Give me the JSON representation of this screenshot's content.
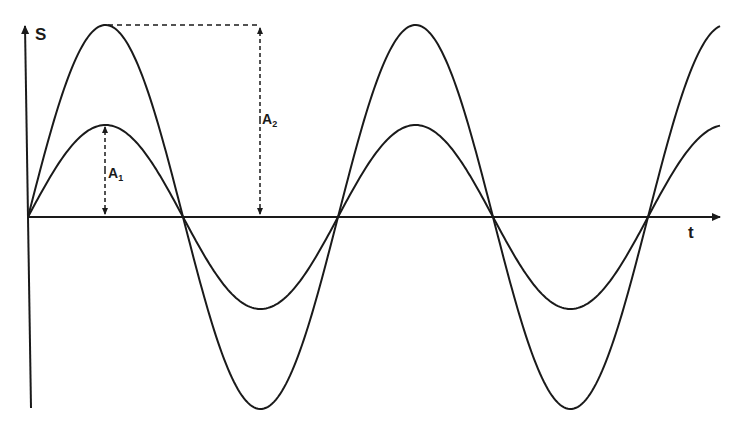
{
  "figure": {
    "y_axis_label": "S",
    "x_axis_label": "t",
    "amplitude_1_label": "A",
    "amplitude_1_sub": "1",
    "amplitude_2_label": "A",
    "amplitude_2_sub": "2"
  },
  "chart_data": {
    "type": "line",
    "title": "",
    "xlabel": "t",
    "ylabel": "S",
    "grid": false,
    "series": [
      {
        "name": "A1 wave",
        "function": "A1*sin(2*pi*t/T)",
        "amplitude_relative": 1.0,
        "cycles_shown": 2.25
      },
      {
        "name": "A2 wave",
        "function": "A2*sin(2*pi*t/T)",
        "amplitude_relative": 1.95,
        "cycles_shown": 2.25
      }
    ],
    "annotations": [
      "A1 (amplitude of smaller wave)",
      "A2 (amplitude of larger wave)"
    ],
    "colors": {
      "line": "#1a1a1a",
      "background": "#ffffff"
    }
  }
}
